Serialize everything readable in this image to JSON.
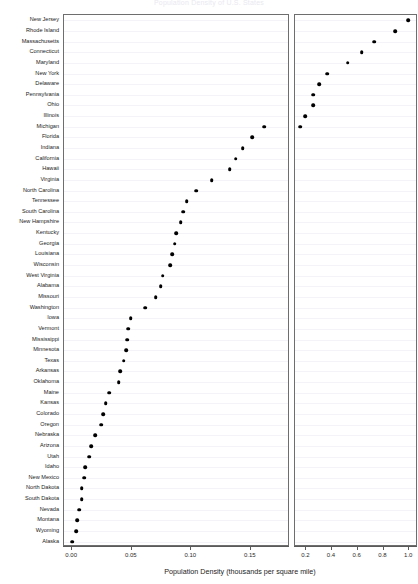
{
  "chart_data": {
    "type": "scatter",
    "title": "Population Density of U.S. States",
    "xlabel": "Population Density (thousands per square mile)",
    "ylabel": "",
    "grid": true,
    "legend": "none",
    "orientation": "horizontal-dotplot",
    "panels": [
      {
        "name": "left-panel",
        "xlim": [
          -0.006,
          0.182
        ],
        "xticks": [
          0.0,
          0.05,
          0.1,
          0.15
        ],
        "xticklabels": [
          "0.00",
          "0.05",
          "0.10",
          "0.15"
        ]
      },
      {
        "name": "right-panel",
        "xlim": [
          0.12,
          1.06
        ],
        "xticks": [
          0.2,
          0.4,
          0.6,
          0.8,
          1.0
        ],
        "xticklabels": [
          "0.2",
          "0.4",
          "0.6",
          "0.8",
          "1.0"
        ]
      }
    ],
    "categories": [
      "New Jersey",
      "Rhode Island",
      "Massachusetts",
      "Connecticut",
      "Maryland",
      "New York",
      "Delaware",
      "Pennsylvania",
      "Ohio",
      "Illinois",
      "Michigan",
      "Florida",
      "Indiana",
      "California",
      "Hawaii",
      "Virginia",
      "North Carolina",
      "Tennessee",
      "South Carolina",
      "New Hampshire",
      "Kentucky",
      "Georgia",
      "Louisiana",
      "Wisconsin",
      "West Virginia",
      "Alabama",
      "Missouri",
      "Washington",
      "Iowa",
      "Vermont",
      "Mississippi",
      "Minnesota",
      "Texas",
      "Arkansas",
      "Oklahoma",
      "Maine",
      "Kansas",
      "Colorado",
      "Oregon",
      "Nebraska",
      "Arizona",
      "Utah",
      "Idaho",
      "New Mexico",
      "North Dakota",
      "South Dakota",
      "Nevada",
      "Montana",
      "Wyoming",
      "Alaska"
    ],
    "values": [
      1.0,
      0.898,
      0.734,
      0.638,
      0.53,
      0.371,
      0.308,
      0.262,
      0.26,
      0.2,
      0.162,
      0.152,
      0.144,
      0.138,
      0.133,
      0.118,
      0.105,
      0.097,
      0.094,
      0.092,
      0.088,
      0.087,
      0.085,
      0.083,
      0.077,
      0.075,
      0.071,
      0.062,
      0.05,
      0.048,
      0.047,
      0.046,
      0.044,
      0.041,
      0.04,
      0.032,
      0.029,
      0.027,
      0.025,
      0.02,
      0.017,
      0.015,
      0.012,
      0.011,
      0.009,
      0.009,
      0.007,
      0.005,
      0.004,
      0.001
    ],
    "right_panel_visible_count": 11
  },
  "axis": {
    "left_ticks": [
      "0.00",
      "0.05",
      "0.10",
      "0.15"
    ],
    "right_ticks": [
      "0.2",
      "0.4",
      "0.6",
      "0.8",
      "1.0"
    ],
    "x_title": "Population Density (thousands per square mile)"
  },
  "title": "Population Density of U.S. States"
}
